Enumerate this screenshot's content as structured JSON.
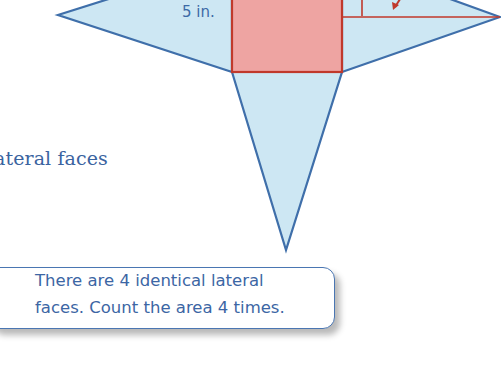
{
  "diagram": {
    "type": "square pyramid net",
    "base": {
      "shape": "square",
      "fill": "#eea4a2",
      "stroke": "#c0392b"
    },
    "lateral_faces": {
      "count_visible": 3,
      "fill": "#cde7f3",
      "stroke": "#3f6faa"
    },
    "dimension_label": "5 in."
  },
  "body": {
    "text_fragment": "ateral faces"
  },
  "callout": {
    "line1": "There are 4 identical lateral",
    "line2": "faces. Count the area 4 times."
  },
  "colors": {
    "text_blue": "#3c66a4",
    "face_blue": "#cde7f3",
    "base_red": "#eea4a2",
    "edge_blue": "#3f6faa",
    "edge_red": "#c0392b"
  }
}
